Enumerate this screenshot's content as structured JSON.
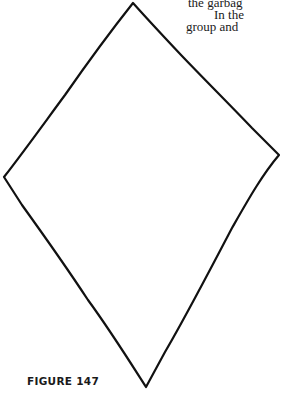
{
  "figure": {
    "caption": "FIGURE 147",
    "shape": "kite",
    "vertices": {
      "top": [
        133,
        3
      ],
      "right": [
        279,
        155
      ],
      "bottom": [
        146,
        387
      ],
      "left": [
        4,
        177
      ]
    },
    "stroke_color": "#111111"
  },
  "text_fragments": [
    "the garbag",
    "In the",
    "group and"
  ]
}
